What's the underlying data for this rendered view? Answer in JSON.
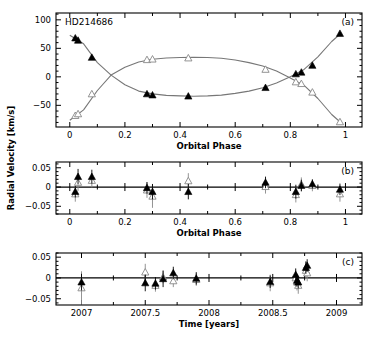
{
  "figure": {
    "ylabel": "Radial Velocity [km/s]",
    "star_name": "HD214686",
    "colors": {
      "primary": "#000000",
      "secondary": "#888888",
      "curve": "#777777",
      "axis": "#000000"
    }
  },
  "chart_data": [
    {
      "id": "a",
      "type": "scatter",
      "panel_label": "(a)",
      "title": "HD214686",
      "xlabel": "Orbital Phase",
      "ylabel": "Radial Velocity [km/s]",
      "xlim": [
        -0.05,
        1.06
      ],
      "ylim": [
        -88,
        112
      ],
      "xticks": [
        0,
        0.2,
        0.4,
        0.6,
        0.8,
        1
      ],
      "xtick_labels": [
        "0",
        "0.2",
        "0.4",
        "0.6",
        "0.8",
        "1"
      ],
      "yticks": [
        -50,
        0,
        50,
        100
      ],
      "ytick_labels": [
        "-50",
        "0",
        "50",
        "100"
      ],
      "series": [
        {
          "name": "primary (filled triangles)",
          "marker": "filled-triangle",
          "x": [
            0.02,
            0.03,
            0.08,
            0.28,
            0.3,
            0.43,
            0.71,
            0.82,
            0.84,
            0.88,
            0.98
          ],
          "y": [
            68,
            64,
            34,
            -30,
            -32,
            -34,
            -19,
            5,
            8,
            20,
            76
          ]
        },
        {
          "name": "secondary (open triangles)",
          "marker": "open-triangle",
          "x": [
            0.02,
            0.03,
            0.08,
            0.28,
            0.3,
            0.43,
            0.71,
            0.82,
            0.84,
            0.88,
            0.98
          ],
          "y": [
            -68,
            -65,
            -30,
            30,
            31,
            33,
            13,
            -9,
            -12,
            -27,
            -79
          ]
        }
      ],
      "curves": [
        {
          "name": "primary orbit fit",
          "x": [
            0,
            0.05,
            0.1,
            0.15,
            0.2,
            0.25,
            0.3,
            0.35,
            0.4,
            0.45,
            0.5,
            0.55,
            0.6,
            0.65,
            0.7,
            0.75,
            0.8,
            0.85,
            0.9,
            0.95,
            0.985
          ],
          "y": [
            73,
            58,
            25,
            3,
            -14,
            -25,
            -30,
            -32.5,
            -33.5,
            -34,
            -33.5,
            -32,
            -29,
            -25,
            -19,
            -11,
            0,
            13,
            35,
            62,
            77
          ]
        },
        {
          "name": "secondary orbit fit",
          "x": [
            0,
            0.05,
            0.1,
            0.15,
            0.2,
            0.25,
            0.3,
            0.35,
            0.4,
            0.45,
            0.5,
            0.55,
            0.6,
            0.65,
            0.7,
            0.75,
            0.8,
            0.85,
            0.9,
            0.95,
            0.985
          ],
          "y": [
            -76,
            -58,
            -24,
            3,
            17,
            26,
            31,
            33,
            34,
            34.5,
            34,
            32.5,
            29.5,
            25,
            19,
            10,
            -2,
            -15,
            -38,
            -66,
            -81
          ]
        }
      ],
      "grid": false
    },
    {
      "id": "b",
      "type": "scatter",
      "panel_label": "(b)",
      "xlabel": "Orbital Phase",
      "xlim": [
        -0.05,
        1.06
      ],
      "ylim": [
        -0.07,
        0.065
      ],
      "xticks": [
        0,
        0.2,
        0.4,
        0.6,
        0.8,
        1
      ],
      "xtick_labels": [
        "0",
        "0.2",
        "0.4",
        "0.6",
        "0.8",
        "1"
      ],
      "yticks": [
        -0.05,
        0,
        0.05
      ],
      "ytick_labels": [
        "-0.05",
        "0",
        "0.05"
      ],
      "zero_line": true,
      "series": [
        {
          "name": "primary O-C",
          "marker": "filled-triangle",
          "x": [
            0.02,
            0.03,
            0.08,
            0.28,
            0.3,
            0.43,
            0.71,
            0.82,
            0.84,
            0.88,
            0.98
          ],
          "y": [
            -0.012,
            0.027,
            0.027,
            -0.002,
            -0.012,
            -0.012,
            0.012,
            -0.012,
            0.004,
            0.008,
            -0.006
          ],
          "err": [
            0.015,
            0.02,
            0.018,
            0.015,
            0.02,
            0.02,
            0.015,
            0.018,
            0.015,
            0.012,
            0.015
          ]
        },
        {
          "name": "secondary O-C",
          "marker": "open-triangle",
          "x": [
            0.02,
            0.03,
            0.08,
            0.28,
            0.3,
            0.43,
            0.71,
            0.82,
            0.84,
            0.88,
            0.98
          ],
          "y": [
            -0.018,
            0.012,
            0.017,
            -0.008,
            -0.024,
            0.016,
            0.001,
            -0.02,
            0.007,
            0.004,
            -0.018
          ],
          "err": [
            0.02,
            0.022,
            0.018,
            0.02,
            0.03,
            0.02,
            0.018,
            0.02,
            0.018,
            0.015,
            0.02
          ]
        }
      ],
      "grid": false
    },
    {
      "id": "c",
      "type": "scatter",
      "panel_label": "(c)",
      "xlabel": "Time [years]",
      "xlim": [
        2006.8,
        2009.2
      ],
      "ylim": [
        -0.065,
        0.06
      ],
      "xticks": [
        2007,
        2007.5,
        2008,
        2008.5,
        2009
      ],
      "xtick_labels": [
        "2007",
        "2007.5",
        "2008",
        "2008.5",
        "2009"
      ],
      "yticks": [
        -0.05,
        0,
        0.05
      ],
      "ytick_labels": [
        "-0.05",
        "0",
        "0.05"
      ],
      "zero_line": true,
      "series": [
        {
          "name": "primary O-C",
          "marker": "filled-triangle",
          "x": [
            2007.0,
            2007.5,
            2007.58,
            2007.64,
            2007.72,
            2007.9,
            2008.48,
            2008.68,
            2008.69,
            2008.7,
            2008.76,
            2008.77
          ],
          "y": [
            -0.01,
            -0.012,
            -0.013,
            -0.002,
            0.012,
            -0.001,
            -0.009,
            0.008,
            -0.006,
            -0.01,
            0.025,
            0.03
          ],
          "err": [
            0.02,
            0.02,
            0.015,
            0.02,
            0.015,
            0.015,
            0.015,
            0.015,
            0.015,
            0.015,
            0.015,
            0.015
          ]
        },
        {
          "name": "secondary O-C",
          "marker": "open-triangle",
          "x": [
            2007.0,
            2007.5,
            2007.58,
            2007.64,
            2007.72,
            2007.9,
            2008.48,
            2008.68,
            2008.69,
            2008.7,
            2008.76,
            2008.77
          ],
          "y": [
            -0.024,
            0.014,
            -0.018,
            0.002,
            -0.007,
            -0.004,
            -0.012,
            0.0,
            -0.01,
            -0.018,
            0.018,
            0.012
          ],
          "err": [
            0.04,
            0.02,
            0.015,
            0.015,
            0.015,
            0.015,
            0.02,
            0.02,
            0.02,
            0.02,
            0.02,
            0.02
          ]
        }
      ],
      "grid": false
    }
  ]
}
